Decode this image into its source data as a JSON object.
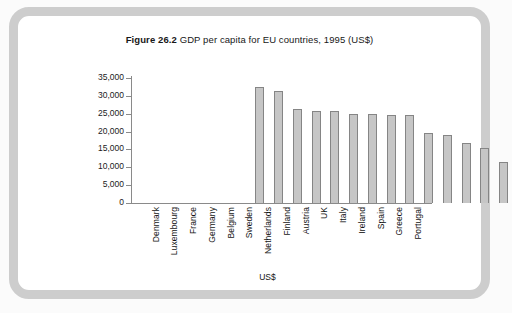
{
  "figure": {
    "number": "Figure 26.2",
    "caption": "GDP per capita for EU countries, 1995 (US$)"
  },
  "chart_data": {
    "type": "bar",
    "title": "Figure 26.2 GDP per capita for EU countries, 1995 (US$)",
    "xlabel": "US$",
    "ylabel": "",
    "ylim": [
      0,
      35000
    ],
    "grid": false,
    "legend": null,
    "ytick_labels": [
      "35,000",
      "30,000",
      "25,000",
      "20,000",
      "15,000",
      "10,000",
      "5,000",
      "0"
    ],
    "ytick_values": [
      35000,
      30000,
      25000,
      20000,
      15000,
      10000,
      5000,
      0
    ],
    "categories": [
      "Denmark",
      "Luxembourg",
      "France",
      "Germany",
      "Belgium",
      "Sweden",
      "Netherlands",
      "Finland",
      "Austria",
      "UK",
      "Italy",
      "Ireland",
      "Spain",
      "Greece",
      "Portugal"
    ],
    "values": [
      32500,
      31300,
      26300,
      25700,
      25700,
      25000,
      24800,
      24700,
      24600,
      19700,
      19000,
      16800,
      15400,
      11500,
      10400
    ]
  }
}
